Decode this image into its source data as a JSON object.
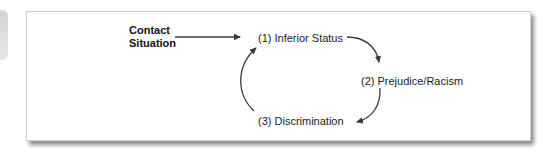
{
  "diagram": {
    "type": "cycle-flow",
    "start": {
      "line1": "Contact",
      "line2": "Situation"
    },
    "nodes": [
      {
        "id": 1,
        "label": "(1) Inferior Status"
      },
      {
        "id": 2,
        "label": "(2) Prejudice/Racism"
      },
      {
        "id": 3,
        "label": "(3) Discrimination"
      }
    ],
    "edges": [
      {
        "from": "Contact Situation",
        "to": "(1) Inferior Status",
        "style": "straight"
      },
      {
        "from": "(1) Inferior Status",
        "to": "(2) Prejudice/Racism",
        "style": "curved"
      },
      {
        "from": "(2) Prejudice/Racism",
        "to": "(3) Discrimination",
        "style": "curved"
      },
      {
        "from": "(3) Discrimination",
        "to": "(1) Inferior Status",
        "style": "curved"
      }
    ],
    "colors": {
      "arrow": "#3a3a3a",
      "text": "#1a1a1a",
      "frame_border": "#d0d0d0"
    }
  }
}
